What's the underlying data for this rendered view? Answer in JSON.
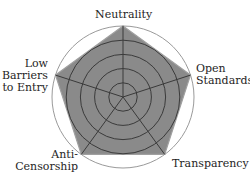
{
  "chart_data": {
    "type": "radar",
    "title": "",
    "axes": [
      "Neutrality",
      "Open Standards",
      "Transparency",
      "Anti-Censorship",
      "Low Barriers to Entry"
    ],
    "series": [
      {
        "name": "",
        "values": [
          5,
          5,
          5,
          5,
          5
        ],
        "fill": "#8a8a8a",
        "stroke": "#a0a0a0"
      }
    ],
    "rlim": [
      0,
      5
    ],
    "rings": [
      1,
      2,
      3,
      4,
      5
    ],
    "ring_color": "#3a3a3a",
    "outer_ring_color": "#9a9a9a",
    "spoke_color": "#3a3a3a",
    "grid": true,
    "legend": false
  },
  "labels": {
    "neutrality": "Neutrality",
    "open_standards_1": "Open",
    "open_standards_2": "Standards",
    "transparency": "Transparency",
    "anti_censorship_1": "Anti-",
    "anti_censorship_2": "Censorship",
    "low_barriers_1": "Low",
    "low_barriers_2": "Barriers",
    "low_barriers_3": "to Entry"
  }
}
